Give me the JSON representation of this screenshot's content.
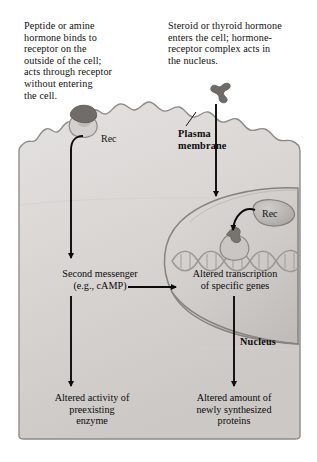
{
  "figure": {
    "type": "biology-diagram"
  },
  "captions": {
    "left": "Peptide or amine\nhormone binds to\nreceptor on the\noutside of the cell;\nacts through receptor\nwithout entering\nthe cell.",
    "right": "Steroid or thyroid hormone\nenters the cell; hormone-\nreceptor complex acts in\nthe nucleus."
  },
  "labels": {
    "receptor_membrane": "Rec",
    "receptor_nucleus": "Rec",
    "plasma_membrane": "Plasma\nmembrane",
    "nucleus": "Nucleus"
  },
  "flow": {
    "second_messenger": "Second messenger\n(e.g., cAMP)",
    "altered_transcription": "Altered transcription\nof specific genes",
    "altered_enzyme": "Altered activity of\npreexisting\nenzyme",
    "altered_protein": "Altered amount of\nnewly synthesized\nproteins"
  },
  "colors": {
    "background": "#ffffff",
    "cytoplasm_light": "#dedcda",
    "cytoplasm_dark": "#c9c6c3",
    "membrane_outline": "#8d8a88",
    "nucleus_fill": "#d2cfcd",
    "nucleus_outline": "#8a8785",
    "hormone_dark": "#6e6b69",
    "receptor_gray": "#b3b0ad",
    "dna_gray": "#a7a4a1",
    "arrow_black": "#0b0b0b",
    "text": "#101010"
  }
}
